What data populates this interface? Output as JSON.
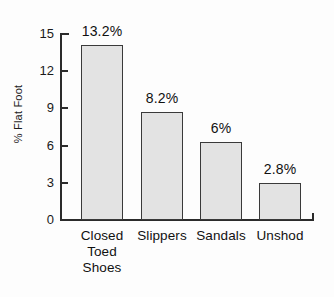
{
  "chart_data": {
    "type": "bar",
    "title": "",
    "xlabel": "",
    "ylabel": "% Flat Foot",
    "categories": [
      "Closed\nToed\nShoes",
      "Slippers",
      "Sandals",
      "Unshod"
    ],
    "category_labels_flat": [
      "Closed Toed Shoes",
      "Slippers",
      "Sandals",
      "Unshod"
    ],
    "values": [
      14.1,
      8.7,
      6.3,
      2.95
    ],
    "data_labels": [
      "13.2%",
      "8.2%",
      "6%",
      "2.8%"
    ],
    "ylim": [
      0,
      15
    ],
    "yticks": [
      0,
      3,
      6,
      9,
      12,
      15
    ],
    "ytick_labels": [
      "0",
      "3",
      "6",
      "9",
      "12",
      "15"
    ],
    "grid": false,
    "legend": "none",
    "bar_fill_color": "#e3e3e3",
    "bar_edge_color": "#3a3a3a",
    "axis_color": "#2b2b2b",
    "background_color": "#fdfdfd"
  }
}
